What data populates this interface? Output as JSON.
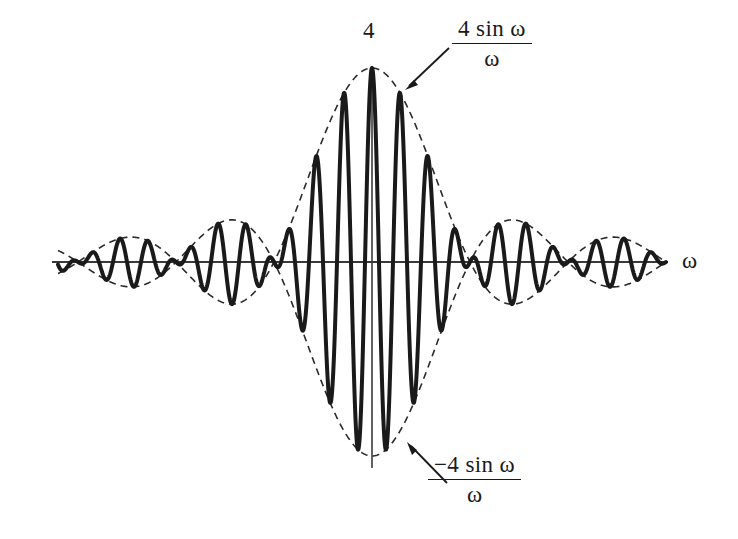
{
  "figure": {
    "title_peak_value": "4",
    "axis_label_x": "ω",
    "annotations": {
      "upper_envelope": {
        "numerator": "4 sin ω",
        "denominator": "ω"
      },
      "lower_envelope": {
        "numerator": "−4 sin ω",
        "denominator": "ω"
      }
    },
    "colors": {
      "curve": "#1a1a1a",
      "envelope": "#2b2b2b",
      "axis": "#3a3a3a",
      "background": "#ffffff",
      "text": "#1a1a1a"
    }
  },
  "chart_data": {
    "type": "line",
    "title": "",
    "xlabel": "ω",
    "ylabel": "",
    "grid": false,
    "legend": null,
    "peak_amplitude": 4,
    "peak_label": "4",
    "x_axis": {
      "visible": true,
      "y_value": 0,
      "arrow": false,
      "label": "ω"
    },
    "y_axis": {
      "visible": true,
      "x_value": 0,
      "label": ""
    },
    "x_range": [
      -9.4248,
      9.4248
    ],
    "y_range": [
      -4.2,
      4.4
    ],
    "envelope_nodes_x": [
      -6.2832,
      -3.1416,
      3.1416,
      6.2832
    ],
    "series": [
      {
        "name": "4 sin(ω)/ω · cos(7ω)",
        "style": "solid",
        "linewidth": 4,
        "formula": "4*sin(w)/w*cos(7*w)",
        "carrier_frequency": 7,
        "description": "modulated oscillation bounded by the sinc envelope"
      },
      {
        "name": "4 sin ω / ω",
        "style": "dashed",
        "linewidth": 1.6,
        "formula": "4*sin(w)/w",
        "description": "upper envelope"
      },
      {
        "name": "−4 sin ω / ω",
        "style": "dashed",
        "linewidth": 1.6,
        "formula": "-4*sin(w)/w",
        "description": "lower envelope"
      }
    ],
    "annotations": [
      {
        "text": "4 sin ω / ω",
        "target": "upper envelope",
        "arrow_from": [
          2.2,
          3.95
        ],
        "arrow_to": [
          0.85,
          3.1
        ]
      },
      {
        "text": "−4 sin ω / ω",
        "target": "lower envelope",
        "arrow_from": [
          1.95,
          -3.95
        ],
        "arrow_to": [
          0.78,
          -3.2
        ]
      },
      {
        "text": "4",
        "target": "peak of curve at ω = 0",
        "position": [
          0,
          4
        ]
      }
    ]
  }
}
